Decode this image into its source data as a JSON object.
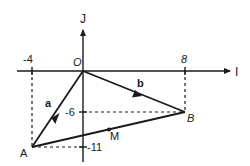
{
  "diagram": {
    "type": "vector-coordinate-diagram",
    "axes": {
      "x_label": "I",
      "y_label": "J",
      "origin_label": "O"
    },
    "ticks": {
      "x_neg": "-4",
      "x_pos": "8",
      "y_mid": "-6",
      "y_low": "-11"
    },
    "points": {
      "A": {
        "label": "A",
        "coords": [
          -4,
          -11
        ]
      },
      "B": {
        "label": "B",
        "coords": [
          8,
          -6
        ]
      },
      "M": {
        "label": "M",
        "note": "point on segment AB"
      },
      "O": {
        "label": "O",
        "coords": [
          0,
          0
        ]
      }
    },
    "vectors": {
      "a": {
        "label": "a",
        "from": "O",
        "to": "A"
      },
      "b": {
        "label": "b",
        "from": "O",
        "to": "B"
      }
    },
    "colors": {
      "ink": "#1a1a1a",
      "background": "#ffffff"
    }
  }
}
